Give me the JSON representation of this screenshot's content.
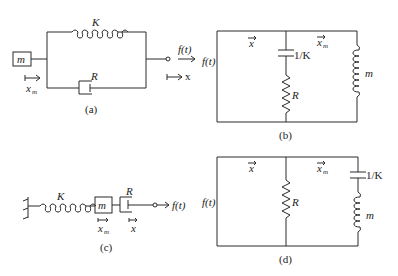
{
  "figure": {
    "panels": [
      {
        "id": "a",
        "caption": "(a)",
        "labels": {
          "spring": "K",
          "damper": "R",
          "mass": "m",
          "force": "f(t)",
          "mass_displacement": "x",
          "mass_displacement_sub": "m",
          "displacement": "x"
        }
      },
      {
        "id": "b",
        "caption": "(b)",
        "labels": {
          "source": "f(t)",
          "velocity": "x",
          "mass_velocity": "x",
          "mass_velocity_sub": "m",
          "capacitor": "1/K",
          "resistor": "R",
          "inductor": "m"
        }
      },
      {
        "id": "c",
        "caption": "(c)",
        "labels": {
          "spring": "K",
          "mass": "m",
          "damper": "R",
          "force": "f(t)",
          "mass_displacement": "x",
          "mass_displacement_sub": "m",
          "displacement": "x"
        }
      },
      {
        "id": "d",
        "caption": "(d)",
        "labels": {
          "source": "f(t)",
          "velocity": "x",
          "mass_velocity": "x",
          "mass_velocity_sub": "m",
          "capacitor": "1/K",
          "resistor": "R",
          "inductor": "m"
        }
      }
    ]
  }
}
